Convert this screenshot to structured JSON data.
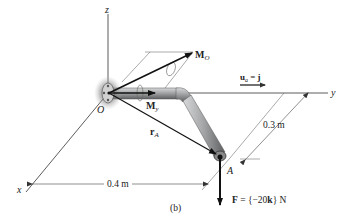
{
  "figure": {
    "caption": "(b)",
    "axes": {
      "x": "x",
      "y": "y",
      "z": "z"
    },
    "origin_label": "O",
    "point_label": "A",
    "moment_O": {
      "symbol": "M",
      "subscript": "O"
    },
    "moment_y": {
      "symbol": "M",
      "subscript": "y"
    },
    "position_vector": {
      "symbol": "r",
      "subscript": "A"
    },
    "unit_vector": {
      "symbol": "u",
      "subscript": "a",
      "equals": " = ",
      "value": "j"
    },
    "force": {
      "symbol": "F",
      "equals": " = {−20",
      "bold_unit": "k",
      "close": "} N"
    },
    "dimensions": {
      "horizontal": "0.4 m",
      "diagonal": "0.3 m"
    }
  },
  "colors": {
    "line": "#222222",
    "pipe_fill": "#a9aaab",
    "pipe_dark": "#6f7072",
    "support_glow": "#7d7d7d"
  }
}
